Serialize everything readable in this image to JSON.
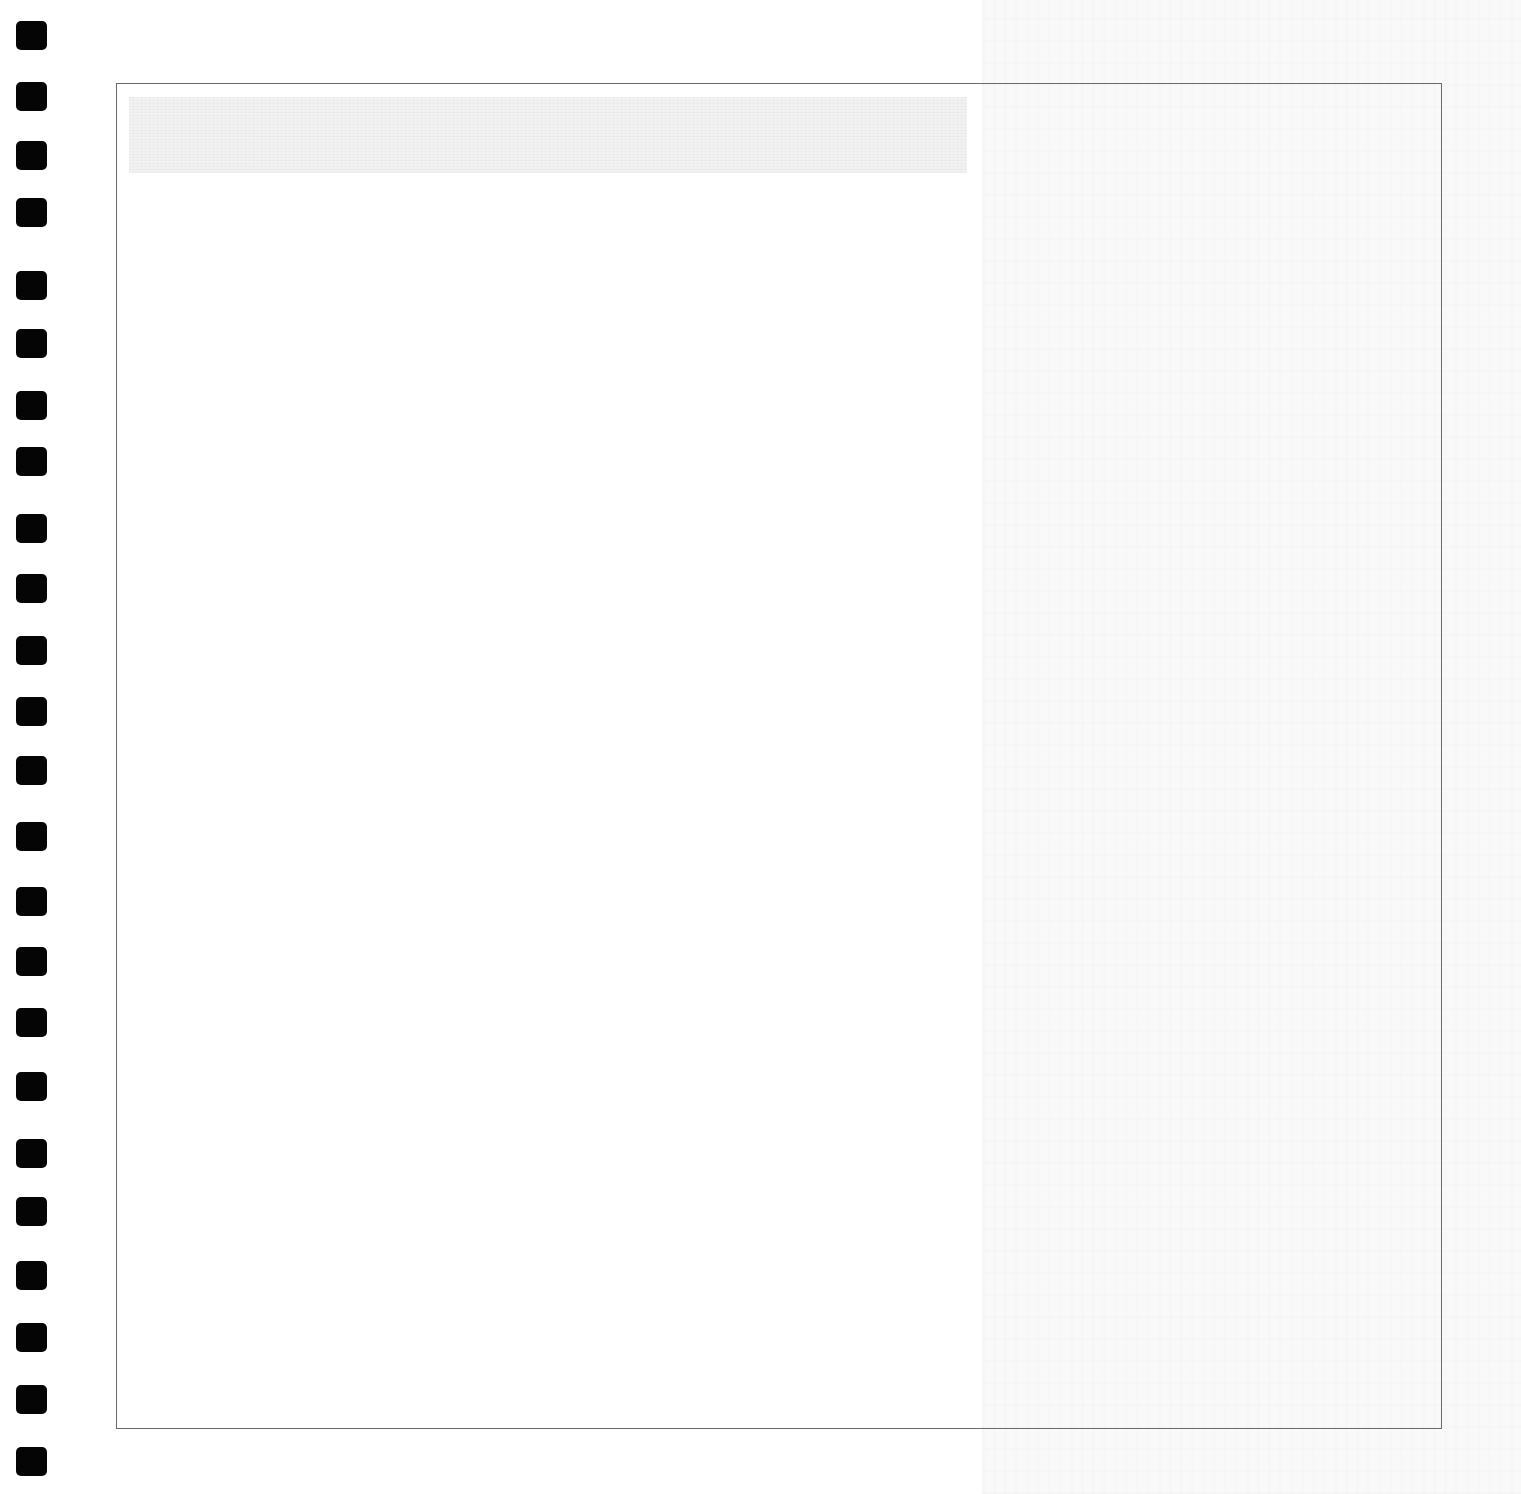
{
  "page": {
    "type": "scanned notebook page",
    "background_color": "#ffffff",
    "bleed_band_color": "#f9f9f9"
  },
  "punch_strip": {
    "hole_color": "#050505",
    "hole_count": 24,
    "hole_tops": [
      21,
      82,
      141,
      198,
      271,
      329,
      391,
      447,
      514,
      574,
      636,
      697,
      756,
      822,
      887,
      947,
      1008,
      1072,
      1139,
      1197,
      1261,
      1323,
      1385,
      1447
    ]
  },
  "frame": {
    "border_color": "#6a6a6a",
    "title_band": {
      "text": "",
      "color": "#f1f1f1"
    },
    "content": {
      "text": ""
    }
  }
}
